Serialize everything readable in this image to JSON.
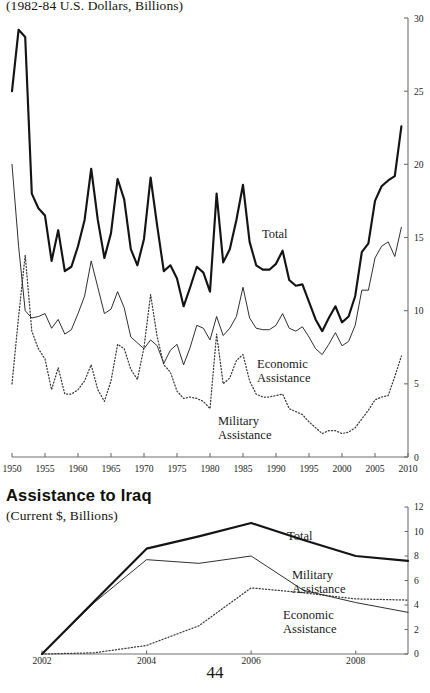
{
  "page": {
    "number": "44"
  },
  "top_chart": {
    "subtitle": "(1982-84 U.S. Dollars, Billions)",
    "labels": {
      "total": "Total",
      "economic_line1": "Economic",
      "economic_line2": "Assistance",
      "military_line1": "Military",
      "military_line2": "Assistance"
    }
  },
  "bottom_chart": {
    "title": "Assistance to Iraq",
    "subtitle": "(Current $, Billions)",
    "labels": {
      "total": "Total",
      "military_line1": "Military",
      "military_line2": "Assistance",
      "economic_line1": "Economic",
      "economic_line2": "Assistance"
    }
  },
  "chart_data": [
    {
      "id": "us-foreign-assistance-1950-2009",
      "type": "line",
      "title": "",
      "subtitle": "(1982-84 U.S. Dollars, Billions)",
      "xlabel": "",
      "ylabel": "(1982-84 U.S. Dollars, Billions)",
      "xlim": [
        1950,
        2010
      ],
      "ylim": [
        0,
        30
      ],
      "xticks": [
        1950,
        1955,
        1960,
        1965,
        1970,
        1975,
        1980,
        1985,
        1990,
        1995,
        2000,
        2005,
        2010
      ],
      "yticks": [
        0,
        5,
        10,
        15,
        20,
        25,
        30
      ],
      "y_axis_position": "right",
      "grid": false,
      "legend": "inline-annotations",
      "x": [
        1950,
        1951,
        1952,
        1953,
        1954,
        1955,
        1956,
        1957,
        1958,
        1959,
        1960,
        1961,
        1962,
        1963,
        1964,
        1965,
        1966,
        1967,
        1968,
        1969,
        1970,
        1971,
        1972,
        1973,
        1974,
        1975,
        1976,
        1977,
        1978,
        1979,
        1980,
        1981,
        1982,
        1983,
        1984,
        1985,
        1986,
        1987,
        1988,
        1989,
        1990,
        1991,
        1992,
        1993,
        1994,
        1995,
        1996,
        1997,
        1998,
        1999,
        2000,
        2001,
        2002,
        2003,
        2004,
        2005,
        2006,
        2007,
        2008,
        2009
      ],
      "series": [
        {
          "name": "Total",
          "style": "solid-thick",
          "values": [
            25.0,
            29.2,
            28.7,
            18.0,
            17.0,
            16.5,
            13.4,
            15.5,
            12.7,
            13.0,
            14.4,
            16.2,
            19.7,
            16.2,
            13.6,
            15.3,
            19.0,
            17.6,
            14.2,
            13.1,
            14.9,
            19.1,
            15.8,
            12.7,
            13.1,
            12.2,
            10.3,
            11.6,
            13.0,
            12.6,
            11.3,
            18.0,
            13.3,
            14.2,
            16.2,
            18.6,
            14.7,
            13.1,
            12.8,
            12.8,
            13.2,
            14.1,
            12.1,
            11.7,
            11.8,
            10.6,
            9.4,
            8.6,
            9.5,
            10.3,
            9.2,
            9.6,
            11.0,
            14.0,
            14.6,
            17.5,
            18.5,
            18.9,
            19.2,
            22.6
          ]
        },
        {
          "name": "Economic Assistance",
          "style": "solid-thin",
          "values": [
            20.0,
            14.4,
            10.0,
            9.5,
            9.6,
            9.8,
            8.8,
            9.4,
            8.4,
            8.7,
            9.8,
            11.0,
            13.4,
            11.6,
            9.8,
            10.1,
            11.3,
            10.2,
            8.2,
            7.8,
            7.4,
            8.0,
            7.6,
            6.4,
            7.3,
            7.7,
            6.3,
            7.5,
            9.0,
            8.8,
            8.0,
            9.6,
            8.3,
            8.8,
            9.6,
            11.6,
            9.5,
            8.8,
            8.7,
            8.7,
            9.0,
            9.8,
            8.8,
            8.6,
            8.9,
            8.2,
            7.4,
            7.0,
            7.7,
            8.5,
            7.6,
            7.9,
            9.0,
            11.4,
            11.4,
            13.6,
            14.4,
            14.7,
            13.7,
            15.7
          ]
        },
        {
          "name": "Military Assistance",
          "style": "dotted",
          "values": [
            5.0,
            9.6,
            13.8,
            8.6,
            7.4,
            6.7,
            4.6,
            6.1,
            4.3,
            4.3,
            4.6,
            5.2,
            6.3,
            4.6,
            3.8,
            5.2,
            7.7,
            7.4,
            6.0,
            5.3,
            7.5,
            11.1,
            8.2,
            6.3,
            5.8,
            4.5,
            4.0,
            4.1,
            4.0,
            3.8,
            3.3,
            8.4,
            5.0,
            5.4,
            6.6,
            7.0,
            5.2,
            4.3,
            4.1,
            4.1,
            4.2,
            4.3,
            3.3,
            3.1,
            2.9,
            2.4,
            2.0,
            1.6,
            1.8,
            1.8,
            1.6,
            1.7,
            2.0,
            2.6,
            3.2,
            3.9,
            4.1,
            4.2,
            5.5,
            6.9
          ]
        }
      ]
    },
    {
      "id": "assistance-to-iraq",
      "type": "line",
      "title": "Assistance to Iraq",
      "subtitle": "(Current $, Billions)",
      "xlabel": "",
      "ylabel": "(Current $, Billions)",
      "xlim": [
        2002,
        2009
      ],
      "ylim": [
        0,
        12
      ],
      "xticks": [
        2002,
        2004,
        2006,
        2008
      ],
      "yticks": [
        0,
        2,
        4,
        6,
        8,
        10,
        12
      ],
      "y_axis_position": "right",
      "grid": false,
      "legend": "inline-annotations",
      "x": [
        2002,
        2003,
        2004,
        2005,
        2006,
        2007,
        2008,
        2009
      ],
      "series": [
        {
          "name": "Total",
          "style": "solid-thick",
          "values": [
            0.0,
            4.3,
            8.6,
            9.6,
            10.7,
            9.3,
            8.0,
            7.6
          ]
        },
        {
          "name": "Military Assistance",
          "style": "dotted",
          "values": [
            0.0,
            0.1,
            0.7,
            2.3,
            5.4,
            5.0,
            4.5,
            4.4
          ]
        },
        {
          "name": "Economic Assistance",
          "style": "solid-thin",
          "values": [
            0.0,
            4.2,
            7.7,
            7.4,
            8.0,
            5.2,
            4.2,
            3.4
          ]
        }
      ]
    }
  ]
}
